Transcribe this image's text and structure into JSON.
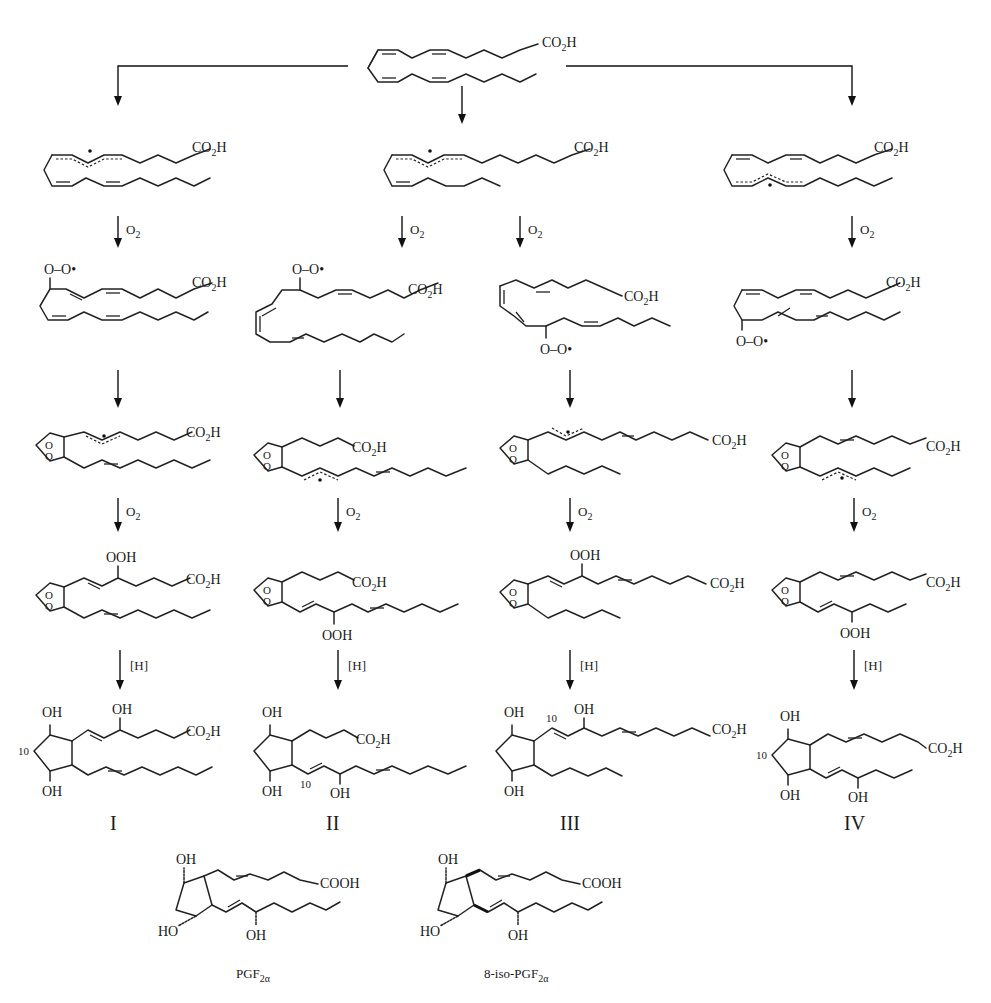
{
  "figure": {
    "title_fragment": "...p...e, ...g..., ...p...",
    "starting_material": {
      "label": "CO2H",
      "name": "arachidonic acid"
    },
    "reagents": {
      "oxygen": "O",
      "oxygen_sub": "2",
      "reduction": "[H]"
    },
    "group_labels": {
      "acid": "CO",
      "acid_sub": "2",
      "acid_end": "H",
      "peroxyl": "O–O•",
      "hydroperoxide": "OOH",
      "hydroxyl": "OH",
      "hydroxyl_left": "HO",
      "carboxyl": "COOH",
      "endoperoxide_o": "O",
      "carbon_number": "10"
    },
    "pathways": [
      {
        "id": "I",
        "label": "I"
      },
      {
        "id": "II",
        "label": "II"
      },
      {
        "id": "III",
        "label": "III"
      },
      {
        "id": "IV",
        "label": "IV"
      }
    ],
    "reference_compounds": [
      {
        "name": "PGF",
        "sub": "2α",
        "full": "PGF2α"
      },
      {
        "name": "8-iso-PGF",
        "sub": "2α",
        "full": "8-iso-PGF2α"
      }
    ]
  }
}
